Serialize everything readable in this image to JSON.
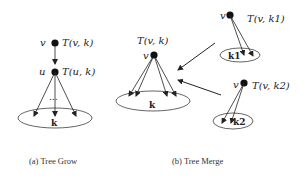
{
  "tree_grow": {
    "caption": "(a) Tree Grow",
    "node_v": {
      "name": "v",
      "label": "T(v, k)"
    },
    "node_u": {
      "name": "u",
      "label": "T(u, k)"
    },
    "ellipsis": "...",
    "set_label": "k"
  },
  "tree_merge": {
    "caption": "(b) Tree Merge",
    "main_tree": {
      "node": "v",
      "label": "T(v, k)",
      "set_label": "k"
    },
    "sub_tree_1": {
      "node": "v",
      "label": "T(v, k1)",
      "set_label": "k1"
    },
    "sub_tree_2": {
      "node": "v",
      "label": "T(v, k2)",
      "set_label": "k2"
    }
  },
  "colors": {
    "stroke": "#222222",
    "background": "#ffffff"
  }
}
